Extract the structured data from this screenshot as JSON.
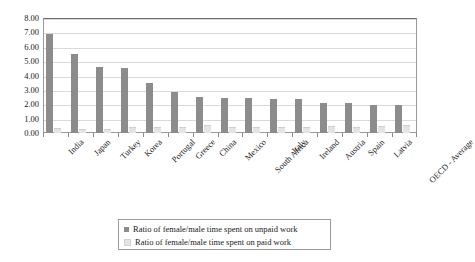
{
  "chart_data": {
    "type": "bar",
    "title": "",
    "xlabel": "",
    "ylabel": "",
    "ylim": [
      0,
      8
    ],
    "ytick_step": 1,
    "ytick_labels": [
      "0.00",
      "1.00",
      "2.00",
      "3.00",
      "4.00",
      "5.00",
      "6.00",
      "7.00",
      "8.00"
    ],
    "grid": true,
    "legend_position": "bottom",
    "categories": [
      "India",
      "Japan",
      "Turkey",
      "Korea",
      "Portugal",
      "Greece",
      "China",
      "Mexico",
      "South Africa",
      "Italy",
      "Ireland",
      "Austria",
      "Spain",
      "Latvia",
      "OECD - Average"
    ],
    "series": [
      {
        "name": "Ratio of female/male time spent on unpaid work",
        "color": "#8c8c8c",
        "values": [
          6.9,
          5.5,
          4.6,
          4.55,
          3.5,
          2.85,
          2.5,
          2.45,
          2.45,
          2.4,
          2.4,
          2.1,
          2.1,
          1.95,
          1.95
        ]
      },
      {
        "name": "Ratio of female/male time spent on paid work",
        "color": "#e4e4e4",
        "values": [
          0.35,
          0.3,
          0.25,
          0.45,
          0.4,
          0.45,
          0.55,
          0.4,
          0.4,
          0.45,
          0.45,
          0.5,
          0.45,
          0.5,
          0.55
        ]
      }
    ]
  },
  "legend": {
    "items": [
      {
        "label": "Ratio of female/male time spent on unpaid work",
        "color": "#8c8c8c"
      },
      {
        "label": "Ratio of female/male time spent on paid work",
        "color": "#e4e4e4"
      }
    ]
  }
}
